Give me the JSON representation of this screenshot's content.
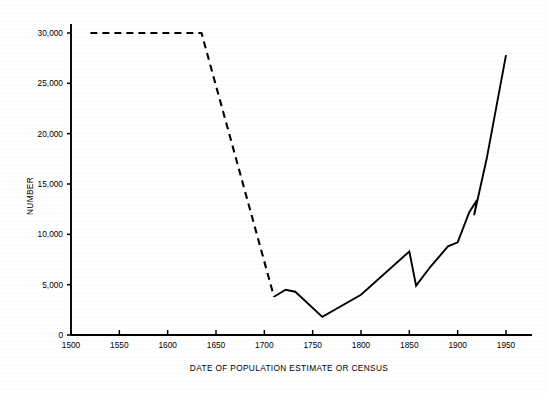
{
  "chart_data": {
    "type": "line",
    "title": "",
    "xlabel": "DATE OF POPULATION ESTIMATE OR CENSUS",
    "ylabel": "NUMBER",
    "xlim": [
      1500,
      1950
    ],
    "ylim": [
      0,
      30000
    ],
    "grid": false,
    "legend": "none",
    "xticks": [
      1500,
      1550,
      1600,
      1650,
      1700,
      1750,
      1800,
      1850,
      1900,
      1950
    ],
    "xtick_labels": [
      "1500",
      "1550",
      "1600",
      "1650",
      "1700",
      "1750",
      "1800",
      "1850",
      "1900",
      "1950"
    ],
    "yticks": [
      0,
      5000,
      10000,
      15000,
      20000,
      25000,
      30000
    ],
    "ytick_labels": [
      "0",
      "5,000",
      "10,000",
      "15,000",
      "20,000",
      "25,000",
      "30,000"
    ],
    "series": [
      {
        "name": "estimated population (dashed)",
        "style": "dashed",
        "color": "#000000",
        "x": [
          1520,
          1635,
          1710
        ],
        "values": [
          30000,
          30000,
          3800
        ]
      },
      {
        "name": "census population (solid)",
        "style": "solid",
        "color": "#000000",
        "x": [
          1710,
          1722,
          1732,
          1760,
          1800,
          1850,
          1857,
          1872,
          1890,
          1900,
          1912,
          1920,
          1917,
          1930,
          1950
        ],
        "values": [
          3800,
          4500,
          4300,
          1800,
          4000,
          8300,
          4900,
          6800,
          8800,
          9200,
          12200,
          13400,
          11900,
          17500,
          27800
        ]
      }
    ]
  },
  "axis": {
    "y_label_text": "NUMBER",
    "x_label_text": "DATE OF POPULATION ESTIMATE OR CENSUS"
  }
}
